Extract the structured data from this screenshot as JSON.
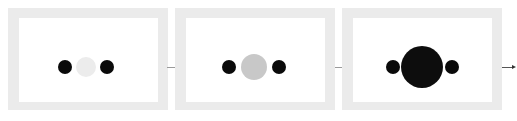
{
  "diagram": {
    "colors": {
      "frame": "#ebebeb",
      "inner": "#ffffff",
      "side_dot": "#0a0a0a",
      "connector": "#9a9a9a"
    },
    "panels": [
      {
        "id": "stage-1",
        "left": 8,
        "side_dot_radius": 7,
        "left_dot_cx": 57,
        "right_dot_cx": 99,
        "center_dot_cx": 78,
        "center_dot_radius": 10,
        "center_dot_color": "#ececec"
      },
      {
        "id": "stage-2",
        "left": 175,
        "side_dot_radius": 7,
        "left_dot_cx": 54,
        "right_dot_cx": 104,
        "center_dot_cx": 79,
        "center_dot_radius": 13,
        "center_dot_color": "#c8c8c8"
      },
      {
        "id": "stage-3",
        "left": 342,
        "side_dot_radius": 7,
        "left_dot_cx": 51,
        "right_dot_cx": 110,
        "center_dot_cx": 80,
        "center_dot_radius": 21,
        "center_dot_color": "#0d0d0d"
      }
    ],
    "connectors": [
      {
        "from": "stage-1",
        "to": "stage-2",
        "x1": 167,
        "x2": 175
      },
      {
        "from": "stage-2",
        "to": "stage-3",
        "x1": 335,
        "x2": 342
      },
      {
        "from": "stage-3",
        "to": "output",
        "x1": 502,
        "x2": 512,
        "arrow": true
      }
    ]
  }
}
